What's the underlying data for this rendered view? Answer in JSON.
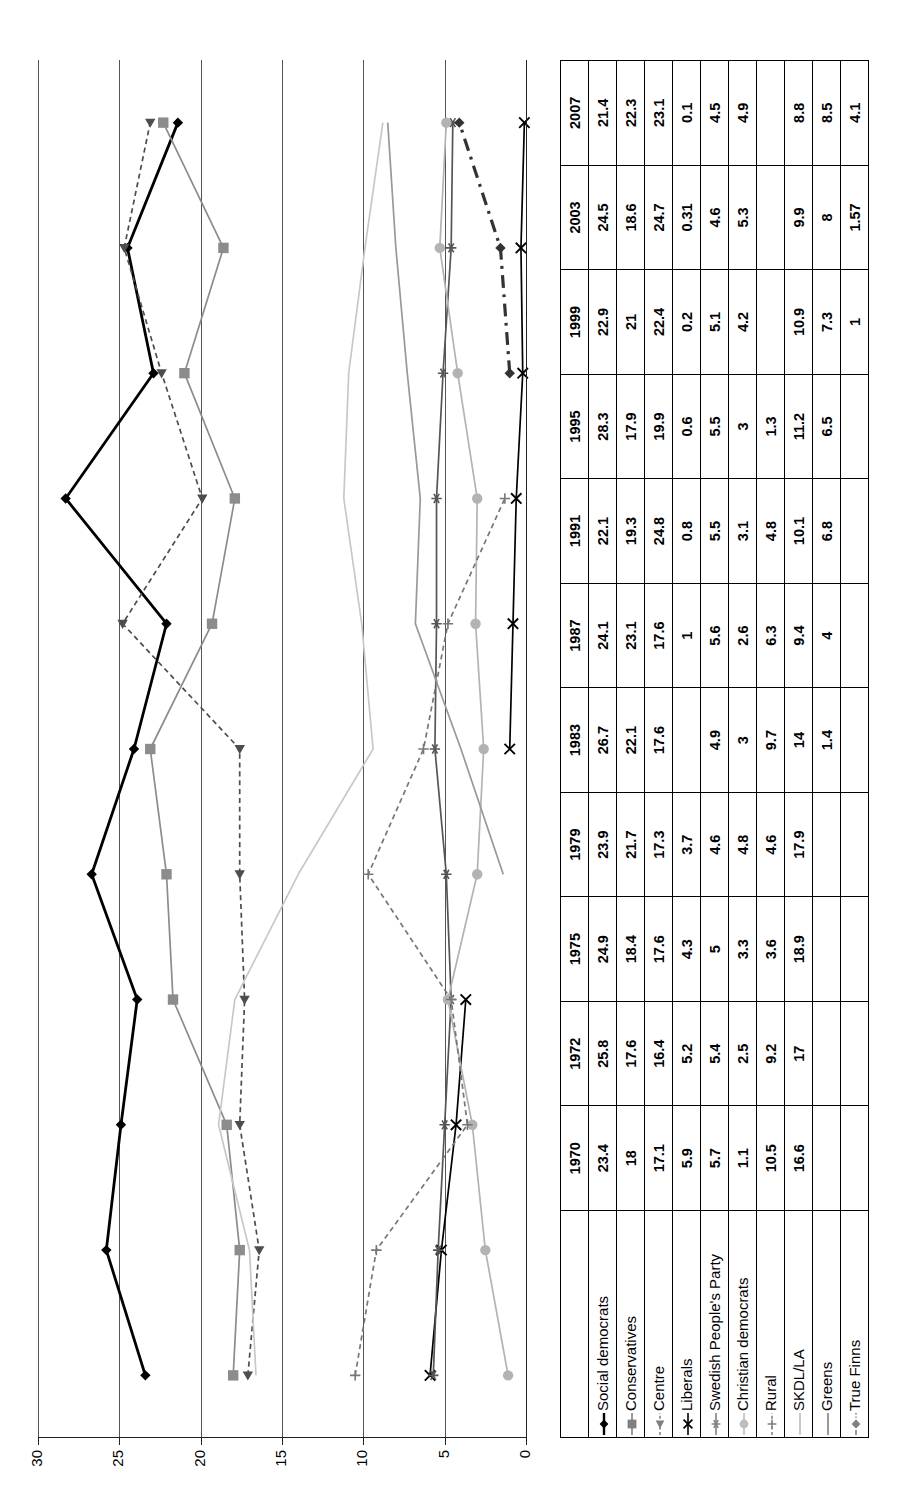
{
  "chart_data": {
    "type": "line",
    "title": "",
    "xlabel": "",
    "ylabel": "",
    "ylim": [
      0,
      30
    ],
    "yticks": [
      0,
      5,
      10,
      15,
      20,
      25,
      30
    ],
    "grid": true,
    "legend_position": "bottom-table",
    "categories": [
      "1970",
      "1972",
      "1975",
      "1979",
      "1983",
      "1987",
      "1991",
      "1995",
      "1999",
      "2003",
      "2007"
    ],
    "series": [
      {
        "name": "Social democrats",
        "marker": "diamond",
        "color": "#000000",
        "style": "solid",
        "values": [
          23.4,
          25.8,
          24.9,
          23.9,
          26.7,
          24.1,
          22.1,
          28.3,
          22.9,
          24.5,
          21.4
        ]
      },
      {
        "name": "Conservatives",
        "marker": "square",
        "color": "#8c8c8c",
        "style": "solid",
        "values": [
          18,
          17.6,
          18.4,
          21.7,
          22.1,
          23.1,
          19.3,
          17.9,
          21,
          18.6,
          22.3
        ]
      },
      {
        "name": "Centre",
        "marker": "triangle",
        "color": "#4d4d4d",
        "style": "dashed",
        "values": [
          17.1,
          16.4,
          17.6,
          17.3,
          17.6,
          17.6,
          24.8,
          19.9,
          22.4,
          24.7,
          23.1
        ]
      },
      {
        "name": "Liberals",
        "marker": "x",
        "color": "#000000",
        "style": "solid",
        "values": [
          5.9,
          5.2,
          4.3,
          3.7,
          null,
          1,
          0.8,
          0.6,
          0.2,
          0.31,
          0.1
        ]
      },
      {
        "name": "Swedish People's Party",
        "marker": "asterisk",
        "color": "#555555",
        "style": "solid",
        "values": [
          5.7,
          5.4,
          5,
          4.6,
          4.9,
          5.6,
          5.5,
          5.5,
          5.1,
          4.6,
          4.5
        ]
      },
      {
        "name": "Christian democrats",
        "marker": "circle",
        "color": "#b3b3b3",
        "style": "solid",
        "values": [
          1.1,
          2.5,
          3.3,
          4.8,
          3,
          2.6,
          3.1,
          3,
          4.2,
          5.3,
          4.9
        ]
      },
      {
        "name": "Rural",
        "marker": "plus",
        "color": "#777777",
        "style": "dashed",
        "values": [
          10.5,
          9.2,
          3.6,
          4.6,
          9.7,
          6.3,
          4.8,
          1.3,
          null,
          null,
          null
        ]
      },
      {
        "name": "SKDL/LA",
        "marker": "none",
        "color": "#c8c8c8",
        "style": "solid",
        "values": [
          16.6,
          17,
          18.9,
          17.9,
          14,
          9.4,
          10.1,
          11.2,
          10.9,
          9.9,
          8.8
        ]
      },
      {
        "name": "Greens",
        "marker": "none",
        "color": "#999999",
        "style": "solid",
        "values": [
          null,
          null,
          null,
          null,
          1.4,
          4,
          6.8,
          6.5,
          7.3,
          8,
          8.5
        ]
      },
      {
        "name": "True Finns",
        "marker": "diamond",
        "color": "#333333",
        "style": "dashdot",
        "values": [
          null,
          null,
          null,
          null,
          null,
          null,
          null,
          null,
          1,
          1.57,
          4.1
        ]
      }
    ]
  },
  "table": {
    "corner_label": "",
    "column_headers": [
      "1970",
      "1972",
      "1975",
      "1979",
      "1983",
      "1987",
      "1991",
      "1995",
      "1999",
      "2003",
      "2007"
    ],
    "rows": [
      {
        "label": "Social democrats",
        "marker": "diamond-black-solid",
        "cells": [
          "23.4",
          "25.8",
          "24.9",
          "23.9",
          "26.7",
          "24.1",
          "22.1",
          "28.3",
          "22.9",
          "24.5",
          "21.4"
        ]
      },
      {
        "label": "Conservatives",
        "marker": "square-gray-solid",
        "cells": [
          "18",
          "17.6",
          "18.4",
          "21.7",
          "22.1",
          "23.1",
          "19.3",
          "17.9",
          "21",
          "18.6",
          "22.3"
        ]
      },
      {
        "label": "Centre",
        "marker": "triangle-gray-dashed",
        "cells": [
          "17.1",
          "16.4",
          "17.6",
          "17.3",
          "17.6",
          "17.6",
          "24.8",
          "19.9",
          "22.4",
          "24.7",
          "23.1"
        ]
      },
      {
        "label": "Liberals",
        "marker": "x-black-solid",
        "cells": [
          "5.9",
          "5.2",
          "4.3",
          "3.7",
          "",
          "1",
          "0.8",
          "0.6",
          "0.2",
          "0.31",
          "0.1"
        ]
      },
      {
        "label": "Swedish People's Party",
        "marker": "asterisk-gray-solid",
        "cells": [
          "5.7",
          "5.4",
          "5",
          "4.6",
          "4.9",
          "5.6",
          "5.5",
          "5.5",
          "5.1",
          "4.6",
          "4.5"
        ]
      },
      {
        "label": "Christian democrats",
        "marker": "circle-lightgray-solid",
        "cells": [
          "1.1",
          "2.5",
          "3.3",
          "4.8",
          "3",
          "2.6",
          "3.1",
          "3",
          "4.2",
          "5.3",
          "4.9"
        ]
      },
      {
        "label": "Rural",
        "marker": "plus-gray-dashed",
        "cells": [
          "10.5",
          "9.2",
          "3.6",
          "4.6",
          "9.7",
          "6.3",
          "4.8",
          "1.3",
          "",
          "",
          ""
        ]
      },
      {
        "label": "SKDL/LA",
        "marker": "line-lightgray-solid",
        "cells": [
          "16.6",
          "17",
          "18.9",
          "17.9",
          "14",
          "9.4",
          "10.1",
          "11.2",
          "10.9",
          "9.9",
          "8.8"
        ]
      },
      {
        "label": "Greens",
        "marker": "line-gray-solid",
        "cells": [
          "",
          "",
          "",
          "",
          "1.4",
          "4",
          "6.8",
          "6.5",
          "7.3",
          "8",
          "8.5"
        ]
      },
      {
        "label": "True Finns",
        "marker": "diamond-gray-dashdot",
        "cells": [
          "",
          "",
          "",
          "",
          "",
          "",
          "",
          "",
          "1",
          "1.57",
          "4.1"
        ]
      }
    ]
  },
  "axis": {
    "tick_labels": [
      "0",
      "5",
      "10",
      "15",
      "20",
      "25",
      "30"
    ]
  },
  "colors": {
    "social_democrats": "#000000",
    "conservatives": "#8c8c8c",
    "centre": "#4d4d4d",
    "liberals": "#000000",
    "swedish_peoples_party": "#555555",
    "christian_democrats": "#b3b3b3",
    "rural": "#777777",
    "skdl_la": "#c8c8c8",
    "greens": "#999999",
    "true_finns": "#333333"
  }
}
